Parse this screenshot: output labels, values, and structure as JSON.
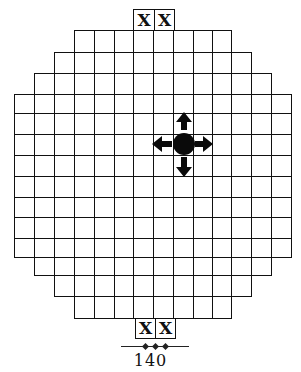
{
  "figure": {
    "grid": {
      "columns": 14,
      "rows": 14,
      "col_edges": [
        14,
        34,
        54,
        74,
        94,
        114,
        133,
        153,
        173,
        193,
        212,
        231,
        251,
        271,
        291
      ],
      "row_edges": [
        30,
        52,
        73,
        94,
        113,
        134,
        155,
        176,
        197,
        217,
        238,
        257,
        275,
        296,
        318
      ],
      "row_spans": [
        [
          3,
          11
        ],
        [
          2,
          12
        ],
        [
          1,
          13
        ],
        [
          0,
          14
        ],
        [
          0,
          14
        ],
        [
          0,
          14
        ],
        [
          0,
          14
        ],
        [
          0,
          14
        ],
        [
          0,
          14
        ],
        [
          0,
          14
        ],
        [
          0,
          14
        ],
        [
          1,
          13
        ],
        [
          2,
          12
        ],
        [
          3,
          11
        ]
      ],
      "line_color": "#111111",
      "fill_color": "#ffffff"
    },
    "goal_squares": {
      "top": [
        {
          "label": "X",
          "x": 133,
          "y": 9,
          "w": 21,
          "h": 21
        },
        {
          "label": "X",
          "x": 154,
          "y": 9,
          "w": 20,
          "h": 21
        }
      ],
      "bottom": [
        {
          "label": "X",
          "x": 135,
          "y": 318,
          "w": 20,
          "h": 20
        },
        {
          "label": "X",
          "x": 155,
          "y": 318,
          "w": 20,
          "h": 20
        }
      ]
    },
    "piece": {
      "shape": "black-disc",
      "col": 8,
      "row": 5,
      "center_x": 184,
      "center_y": 144,
      "color": "#0a0a0a",
      "arrows": [
        "up",
        "down",
        "left",
        "right"
      ]
    },
    "footer": {
      "page_number": "140",
      "ornament": "rule-with-three-diamonds"
    }
  }
}
